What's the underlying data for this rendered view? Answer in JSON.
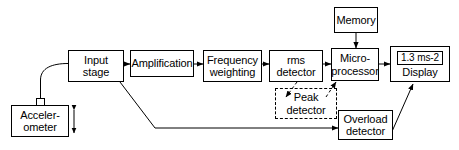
{
  "diagram": {
    "stroke_color": "#000000",
    "background_color": "#ffffff",
    "nodes": {
      "accelerometer": {
        "line1": "Acceler-",
        "line2": "ometer"
      },
      "input_stage": {
        "line1": "Input",
        "line2": "stage"
      },
      "amplification": {
        "line1": "Amplification"
      },
      "frequency_weighting": {
        "line1": "Frequency",
        "line2": "weighting"
      },
      "rms_detector": {
        "line1": "rms",
        "line2": "detector"
      },
      "microprocessor": {
        "line1": "Micro-",
        "line2": "processor"
      },
      "memory": {
        "line1": "Memory"
      },
      "display": {
        "readout": "1.3 ms-2",
        "label": "Display"
      },
      "peak_detector": {
        "line1": "Peak",
        "line2": "detector",
        "style": "dashed"
      },
      "overload_detector": {
        "line1": "Overload",
        "line2": "detector"
      }
    },
    "connections": [
      {
        "name": "accelerometer-to-input-stage",
        "style": "solid-curve",
        "arrow": false
      },
      {
        "name": "input-stage-to-amplification",
        "style": "solid",
        "arrow": true
      },
      {
        "name": "amplification-to-frequency-weighting",
        "style": "solid",
        "arrow": true
      },
      {
        "name": "frequency-weighting-to-rms-detector",
        "style": "solid",
        "arrow": true
      },
      {
        "name": "rms-detector-to-microprocessor",
        "style": "solid",
        "arrow": true
      },
      {
        "name": "microprocessor-to-display",
        "style": "solid",
        "arrow": true
      },
      {
        "name": "memory-to-microprocessor",
        "style": "solid",
        "arrow": true
      },
      {
        "name": "frequency-weighting-to-peak-detector",
        "style": "dashed",
        "arrow": true
      },
      {
        "name": "peak-detector-to-microprocessor",
        "style": "dashed",
        "arrow": true
      },
      {
        "name": "input-stage-to-overload-detector",
        "style": "solid",
        "arrow": true
      },
      {
        "name": "overload-detector-to-display",
        "style": "solid",
        "arrow": true
      },
      {
        "name": "accelerometer-motion-axis",
        "style": "solid",
        "arrow": "double-vertical"
      }
    ]
  }
}
